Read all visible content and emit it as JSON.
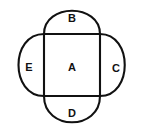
{
  "figure": {
    "kind": "geometric-net-diagram",
    "canvas": {
      "width": 142,
      "height": 136
    },
    "background_color": "#ffffff",
    "stroke_color": "#111111",
    "stroke_width": 2.1,
    "square": {
      "label": "A",
      "left": 44,
      "top": 34,
      "right": 100,
      "bottom": 96
    },
    "regions": [
      {
        "id": "center",
        "label": "A",
        "shape": "square",
        "position": "center",
        "label_x": 72,
        "label_y": 67
      },
      {
        "id": "top",
        "label": "B",
        "shape": "semicircle",
        "position": "top",
        "apex": 4,
        "label_x": 72,
        "label_y": 18
      },
      {
        "id": "right",
        "label": "C",
        "shape": "semicircle",
        "position": "right",
        "apex": 131,
        "label_x": 116,
        "label_y": 68
      },
      {
        "id": "bottom",
        "label": "D",
        "shape": "semicircle",
        "position": "bottom",
        "apex": 130,
        "label_x": 72,
        "label_y": 113
      },
      {
        "id": "left",
        "label": "E",
        "shape": "semicircle",
        "position": "left",
        "apex": 11,
        "label_x": 29,
        "label_y": 67
      }
    ]
  }
}
